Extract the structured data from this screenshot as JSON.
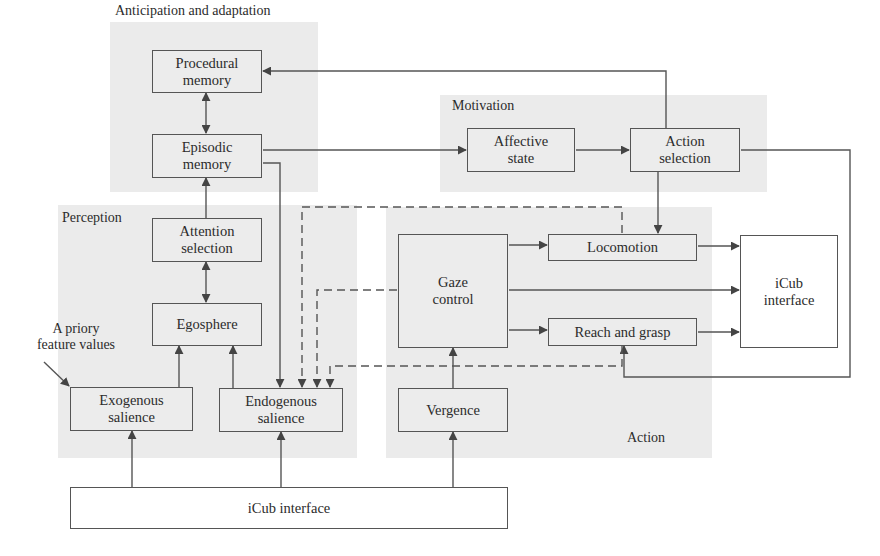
{
  "panels": {
    "anticipation": {
      "label": "Anticipation and adaptation"
    },
    "motivation": {
      "label": "Motivation"
    },
    "perception": {
      "label": "Perception"
    },
    "action": {
      "label": "Action"
    }
  },
  "boxes": {
    "procedural_memory": "Procedural\nmemory",
    "episodic_memory": "Episodic\nmemory",
    "attention_selection": "Attention\nselection",
    "egosphere": "Egosphere",
    "exogenous_salience": "Exogenous\nsalience",
    "endogenous_salience": "Endogenous\nsalience",
    "affective_state": "Affective\nstate",
    "action_selection": "Action\nselection",
    "locomotion": "Locomotion",
    "gaze_control": "Gaze\ncontrol",
    "reach_and_grasp": "Reach and grasp",
    "vergence": "Vergence",
    "icub_interface_output": "iCub\ninterface",
    "icub_interface_input": "iCub interface"
  },
  "annotations": {
    "a_priori": "A priory\nfeature values"
  },
  "colors": {
    "panel_bg": "#ebebeb",
    "line": "#555555"
  }
}
